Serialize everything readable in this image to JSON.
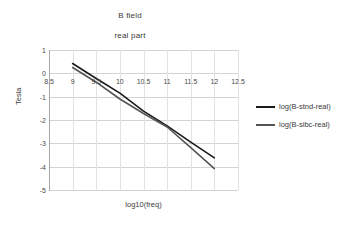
{
  "chart_data": {
    "type": "line",
    "title": "B field",
    "subtitle": "real part",
    "xlabel": "log10(freq)",
    "ylabel": "Tesla",
    "xlim": [
      8.5,
      12.5
    ],
    "ylim": [
      -5,
      1
    ],
    "xticks": [
      "8.5",
      "9",
      "9.5",
      "10",
      "10.5",
      "11",
      "11.5",
      "12",
      "12.5"
    ],
    "xtick_values": [
      8.5,
      9,
      9.5,
      10,
      10.5,
      11,
      11.5,
      12,
      12.5
    ],
    "yticks": [
      "1",
      "0",
      "-1",
      "-2",
      "-3",
      "-4",
      "-5"
    ],
    "ytick_values": [
      1,
      0,
      -1,
      -2,
      -3,
      -4,
      -5
    ],
    "grid": true,
    "legend_position": "right",
    "series": [
      {
        "name": "log(B-stnd-real)",
        "color": "#1a1a1a",
        "x": [
          9.0,
          9.5,
          10.0,
          10.5,
          11.0,
          11.5,
          12.0
        ],
        "y": [
          0.42,
          -0.22,
          -0.85,
          -1.62,
          -2.25,
          -2.95,
          -3.62
        ]
      },
      {
        "name": "log(B-sibc-real)",
        "color": "#545454",
        "x": [
          9.0,
          9.5,
          10.0,
          10.5,
          11.0,
          11.5,
          12.0
        ],
        "y": [
          0.25,
          -0.38,
          -1.1,
          -1.72,
          -2.3,
          -3.18,
          -4.08
        ]
      }
    ]
  },
  "legend": {
    "items": [
      {
        "label": "log(B-stnd-real)",
        "color": "#1a1a1a"
      },
      {
        "label": "log(B-sibc-real)",
        "color": "#545454"
      }
    ]
  },
  "colors": {
    "background": "#ffffff",
    "gridline": "#d4d4d4",
    "axis": "#a8a8a8",
    "text": "#3a3a3a"
  }
}
